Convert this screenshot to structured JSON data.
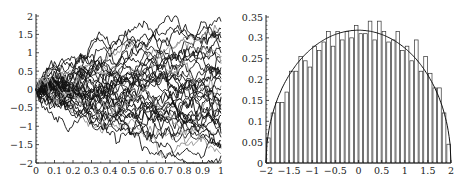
{
  "chart_data": [
    {
      "type": "line",
      "title": "",
      "xlabel": "",
      "ylabel": "",
      "xlim": [
        0,
        1
      ],
      "ylim": [
        -2,
        2
      ],
      "grid": false,
      "x_ticks": [
        "0",
        "0.1",
        "0.2",
        "0.3",
        "0.4",
        "0.5",
        "0.6",
        "0.7",
        "0.8",
        "0.9",
        "1"
      ],
      "y_ticks": [
        "−2",
        "−1.5",
        "−1",
        "−0.5",
        "0",
        "0.5",
        "1",
        "1.5",
        "2"
      ],
      "description": "Ensemble of ~40 random-walk (Brownian) sample paths starting at 0 at t=0, fanning out to roughly ±1.8 at t=1; mostly black, a few gray",
      "num_paths": 40,
      "endpoints_approx": [
        1.85,
        1.65,
        1.55,
        1.5,
        1.4,
        1.3,
        1.15,
        1.0,
        0.9,
        0.8,
        0.7,
        0.6,
        0.5,
        0.45,
        0.4,
        0.3,
        0.2,
        0.1,
        0.0,
        -0.1,
        -0.2,
        -0.25,
        -0.3,
        -0.4,
        -0.5,
        -0.55,
        -0.6,
        -0.65,
        -0.7,
        -0.9,
        -1.05,
        -1.1,
        -1.2,
        -1.3,
        -1.4,
        -1.5,
        -1.55,
        -1.6,
        -1.75,
        -1.8
      ]
    },
    {
      "type": "bar",
      "subtype": "histogram with density curve",
      "title": "",
      "xlabel": "",
      "ylabel": "",
      "xlim": [
        -2,
        2
      ],
      "ylim": [
        0,
        0.35
      ],
      "grid": false,
      "x_ticks": [
        "−2",
        "−1.5",
        "−1",
        "−0.5",
        "0",
        "0.5",
        "1",
        "1.5",
        "2"
      ],
      "y_ticks": [
        "0",
        "0.05",
        "0.1",
        "0.15",
        "0.2",
        "0.25",
        "0.3",
        "0.35"
      ],
      "bin_width": 0.1,
      "categories": [
        -2.0,
        -1.9,
        -1.8,
        -1.7,
        -1.6,
        -1.5,
        -1.4,
        -1.3,
        -1.2,
        -1.1,
        -1.0,
        -0.9,
        -0.8,
        -0.7,
        -0.6,
        -0.5,
        -0.4,
        -0.3,
        -0.2,
        -0.1,
        0.0,
        0.1,
        0.2,
        0.3,
        0.4,
        0.5,
        0.6,
        0.7,
        0.8,
        0.9,
        1.0,
        1.1,
        1.2,
        1.3,
        1.4,
        1.5,
        1.6,
        1.7,
        1.8,
        1.9
      ],
      "values": [
        0.06,
        0.12,
        0.145,
        0.145,
        0.17,
        0.22,
        0.22,
        0.255,
        0.245,
        0.23,
        0.28,
        0.27,
        0.29,
        0.315,
        0.28,
        0.315,
        0.295,
        0.315,
        0.3,
        0.33,
        0.31,
        0.31,
        0.34,
        0.295,
        0.34,
        0.315,
        0.29,
        0.295,
        0.315,
        0.27,
        0.28,
        0.245,
        0.295,
        0.22,
        0.255,
        0.215,
        0.18,
        0.18,
        0.12,
        0.045
      ],
      "curve": {
        "name": "semicircle density",
        "formula": "sqrt(4 - x^2) / (2*pi)",
        "peak": 0.318
      }
    }
  ],
  "colors": {
    "path_dark": "#111111",
    "path_light": "#9a9a9a",
    "bar_stroke": "#333333",
    "axis": "#222222"
  }
}
